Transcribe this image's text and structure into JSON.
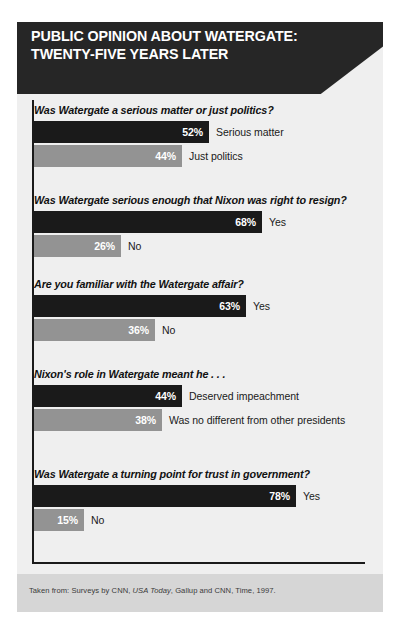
{
  "header": {
    "title_line_1": "PUBLIC OPINION ABOUT WATERGATE:",
    "title_line_2": "TWENTY-FIVE YEARS LATER"
  },
  "footer": {
    "prefix": "Taken from: Surveys by CNN, ",
    "italic": "USA Today",
    "suffix": ", Gallup and CNN, Time, 1997."
  },
  "colors": {
    "header_background": "#262626",
    "card_background": "#efefef",
    "bar_dark": "#1a1a1a",
    "bar_light": "#939393",
    "footer_band": "#d6d6d6",
    "rule": "#1a1a1a"
  },
  "chart_data": {
    "type": "bar",
    "title": "PUBLIC OPINION ABOUT WATERGATE: TWENTY-FIVE YEARS LATER",
    "xlabel": "",
    "ylabel": "",
    "xlim": [
      0,
      100
    ],
    "grid": false,
    "legend": "none",
    "orientation": "horizontal",
    "value_unit": "%",
    "source": "Taken from: Surveys by CNN, USA Today, Gallup and CNN, Time, 1997.",
    "groups": [
      {
        "question": "Was Watergate a serious matter or just politics?",
        "bars": [
          {
            "label": "Serious matter",
            "value": 52,
            "value_text": "52%",
            "color": "dark"
          },
          {
            "label": "Just politics",
            "value": 44,
            "value_text": "44%",
            "color": "light"
          }
        ]
      },
      {
        "question": "Was Watergate serious enough that Nixon was right to resign?",
        "bars": [
          {
            "label": "Yes",
            "value": 68,
            "value_text": "68%",
            "color": "dark"
          },
          {
            "label": "No",
            "value": 26,
            "value_text": "26%",
            "color": "light"
          }
        ]
      },
      {
        "question": "Are you familiar with the Watergate affair?",
        "bars": [
          {
            "label": "Yes",
            "value": 63,
            "value_text": "63%",
            "color": "dark"
          },
          {
            "label": "No",
            "value": 36,
            "value_text": "36%",
            "color": "light"
          }
        ]
      },
      {
        "question": "Nixon's role in Watergate meant he . . .",
        "bars": [
          {
            "label": "Deserved impeachment",
            "value": 44,
            "value_text": "44%",
            "color": "dark"
          },
          {
            "label": "Was no different from other presidents",
            "value": 38,
            "value_text": "38%",
            "color": "light"
          }
        ]
      },
      {
        "question": "Was Watergate a turning point for trust in government?",
        "bars": [
          {
            "label": "Yes",
            "value": 78,
            "value_text": "78%",
            "color": "dark"
          },
          {
            "label": "No",
            "value": 15,
            "value_text": "15%",
            "color": "light"
          }
        ]
      }
    ]
  }
}
